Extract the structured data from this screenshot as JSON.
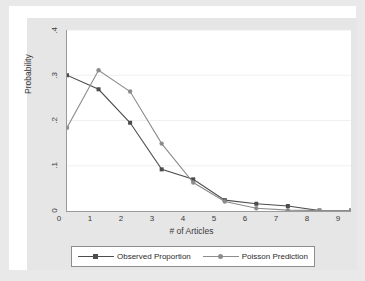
{
  "chart_data": {
    "type": "line",
    "title": "",
    "xlabel": "# of Articles",
    "ylabel": "Probability",
    "x": [
      0,
      1,
      2,
      3,
      4,
      5,
      6,
      7,
      8,
      9
    ],
    "xtick_labels": [
      "0",
      "1",
      "2",
      "3",
      "4",
      "5",
      "6",
      "7",
      "8",
      "9"
    ],
    "ytick_labels": [
      "0",
      ".1",
      ".2",
      ".3",
      ".4"
    ],
    "ytick_values": [
      0,
      0.1,
      0.2,
      0.3,
      0.4
    ],
    "xlim": [
      0,
      9
    ],
    "ylim": [
      0,
      0.4
    ],
    "grid": "horizontal",
    "legend_position": "bottom",
    "series": [
      {
        "name": "Observed Proportion",
        "color": "#4d4d4d",
        "marker": "square",
        "values": [
          0.3,
          0.269,
          0.195,
          0.092,
          0.07,
          0.024,
          0.016,
          0.011,
          0.001,
          0.001
        ]
      },
      {
        "name": "Poisson Prediction",
        "color": "#8c8c8c",
        "marker": "circle",
        "values": [
          0.184,
          0.311,
          0.264,
          0.149,
          0.063,
          0.021,
          0.006,
          0.002,
          0.001,
          0.001
        ]
      }
    ]
  },
  "legend": {
    "entries": [
      {
        "label": "Observed Proportion"
      },
      {
        "label": "Poisson Prediction"
      }
    ]
  },
  "colors": {
    "observed": "#4d4d4d",
    "poisson": "#8c8c8c",
    "axis": "#9a9a9a",
    "grid": "#f0f0f0",
    "page_background": "#e9e9e9",
    "plot_background": "#ffffff"
  }
}
